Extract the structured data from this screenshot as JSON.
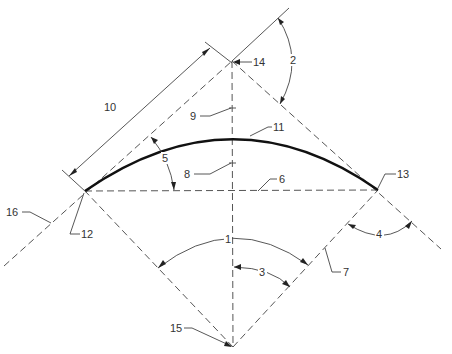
{
  "diagram": {
    "title": "",
    "labels": {
      "l1": "1",
      "l2": "2",
      "l3": "3",
      "l4": "4",
      "l5": "5",
      "l6": "6",
      "l7": "7",
      "l8": "8",
      "l9": "9",
      "l10": "10",
      "l11": "11",
      "l12": "12",
      "l13": "13",
      "l14": "14",
      "l15": "15",
      "l16": "16"
    },
    "points": {
      "apex_14": [
        232,
        61
      ],
      "left_end_12": [
        85,
        191
      ],
      "right_end_13": [
        378,
        190
      ],
      "bottom_15": [
        233,
        347
      ],
      "curve_top": [
        233,
        136
      ]
    },
    "elements": [
      {
        "ref": "1",
        "type": "angle-arc",
        "description": "angle at point 15 between lines to 12 and 13"
      },
      {
        "ref": "2",
        "type": "angle-arc",
        "description": "angle at point 14 between extension and dashed line"
      },
      {
        "ref": "3",
        "type": "angle-arc",
        "description": "half angle at point 15 between vertical and line to 13"
      },
      {
        "ref": "4",
        "type": "angle-arc",
        "description": "angle at point 13 between tangent lines"
      },
      {
        "ref": "5",
        "type": "angle-arc",
        "description": "angle at point 12 between chord and tangent"
      },
      {
        "ref": "6",
        "type": "dashed-line",
        "description": "chord between 12 and 13"
      },
      {
        "ref": "7",
        "type": "dashed-line",
        "description": "line from 15 to 13"
      },
      {
        "ref": "8",
        "type": "dashed-line",
        "description": "vertical segment below curve"
      },
      {
        "ref": "9",
        "type": "dashed-line",
        "description": "vertical segment above curve"
      },
      {
        "ref": "10",
        "type": "dimension",
        "description": "length of tangent 12-14"
      },
      {
        "ref": "11",
        "type": "curve",
        "description": "circular arc from 12 to 13"
      },
      {
        "ref": "12",
        "type": "point",
        "description": "left curve endpoint"
      },
      {
        "ref": "13",
        "type": "point",
        "description": "right curve endpoint"
      },
      {
        "ref": "14",
        "type": "point",
        "description": "tangent intersection"
      },
      {
        "ref": "15",
        "type": "point",
        "description": "arc center"
      },
      {
        "ref": "16",
        "type": "dashed-line",
        "description": "tangent extension"
      }
    ],
    "colors": {
      "background": "#ffffff",
      "line": "#555555",
      "curve": "#111111",
      "text": "#333333"
    }
  }
}
